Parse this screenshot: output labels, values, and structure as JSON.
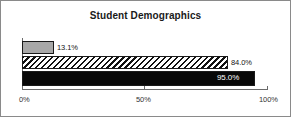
{
  "chart_data": {
    "type": "bar",
    "orientation": "horizontal",
    "title": "Student Demographics",
    "xlabel": "",
    "ylabel": "",
    "xlim": [
      0,
      100
    ],
    "grid": false,
    "legend": null,
    "tick_labels": [
      "0%",
      "50%",
      "100%"
    ],
    "tick_values": [
      0,
      50,
      100
    ],
    "categories": [
      "Series 1",
      "Series 2",
      "Series 3"
    ],
    "values": [
      13.1,
      84.0,
      95.0
    ],
    "data_labels": [
      "13.1%",
      "84.0%",
      "95.0%"
    ],
    "series": [
      {
        "name": "Series 1",
        "value": 13.1,
        "label": "13.1%",
        "fill": "solid-gray",
        "color": "#a8a8a8"
      },
      {
        "name": "Series 2",
        "value": 84.0,
        "label": "84.0%",
        "fill": "diagonal-hatch",
        "color": "#111111"
      },
      {
        "name": "Series 3",
        "value": 95.0,
        "label": "95.0%",
        "fill": "solid-black",
        "color": "#080808"
      }
    ]
  },
  "colors": {
    "frame_border": "#8a8a8a",
    "axis": "#6b6b6b",
    "title_text": "#1a1a1a",
    "tick_text": "#333333",
    "label_text": "#141414",
    "label_text_inverse": "#ffffff",
    "background": "#ffffff"
  }
}
